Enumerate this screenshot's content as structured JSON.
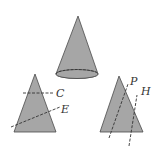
{
  "figure": {
    "colors": {
      "fill": "#a6a6a6",
      "stroke": "#4a4a4a",
      "dash": "#333333",
      "background": "#ffffff"
    },
    "cone": {
      "apex": [
        78,
        16
      ],
      "base_center": [
        77,
        74
      ],
      "base_rx": 21,
      "base_ry": 4.5
    },
    "left_section": {
      "apex": [
        35,
        74
      ],
      "base_left": [
        14,
        132
      ],
      "base_right": [
        56,
        132
      ],
      "lines": [
        {
          "name": "C",
          "from": [
            23,
            93
          ],
          "to": [
            53,
            93
          ],
          "label": "C",
          "label_pos": [
            56,
            88
          ]
        },
        {
          "name": "E",
          "from": [
            11,
            127
          ],
          "to": [
            60,
            107
          ],
          "label": "E",
          "label_pos": [
            61,
            104
          ]
        }
      ]
    },
    "right_section": {
      "apex": [
        119,
        76
      ],
      "base_left": [
        100,
        132
      ],
      "base_right": [
        143,
        132
      ],
      "lines": [
        {
          "name": "P",
          "from": [
            109,
            138
          ],
          "to": [
            128,
            84
          ],
          "label": "P",
          "label_pos": [
            130,
            76
          ]
        },
        {
          "name": "H",
          "from": [
            129,
            146
          ],
          "to": [
            137,
            95
          ],
          "label": "H",
          "label_pos": [
            141,
            86
          ]
        }
      ]
    }
  },
  "labels": {
    "C": "C",
    "E": "E",
    "P": "P",
    "H": "H"
  }
}
